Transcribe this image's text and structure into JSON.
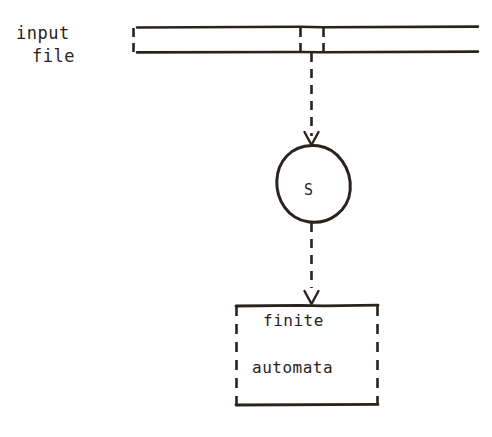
{
  "figure": {
    "background_color": "#ffffff",
    "ink_color": "#2b2220"
  },
  "input_file": {
    "label_line1": "input",
    "label_line2": "file",
    "tape": {
      "left_edge_style": "dashed",
      "right_edge_style": "open",
      "top_line_y": 27,
      "bottom_line_y": 52,
      "left_x": 133,
      "right_x": 478,
      "cell_divider_xs": [
        300,
        323
      ],
      "cell_divider_style": "dashed"
    }
  },
  "scanner_state": {
    "label": "S",
    "shape": "hand-drawn-circle",
    "center_x": 313,
    "center_y": 184,
    "radius_x": 37,
    "radius_y": 39
  },
  "finite_automata_box": {
    "line1": "finite",
    "line2": "automata",
    "left_x": 235,
    "right_x": 378,
    "top_y": 305,
    "bottom_y": 405,
    "horizontal_edge_style": "solid",
    "vertical_edge_style": "dashed"
  },
  "connectors": [
    {
      "name": "tape-to-state",
      "from": "input-file-tape",
      "to": "scanner-state",
      "style": "dashed",
      "arrowhead": "V",
      "x": 311,
      "y_start": 52,
      "y_end": 145
    },
    {
      "name": "state-to-automata",
      "from": "scanner-state",
      "to": "finite-automata-box",
      "style": "dashed",
      "arrowhead": "V",
      "x": 311,
      "y_start": 222,
      "y_end": 305
    }
  ]
}
